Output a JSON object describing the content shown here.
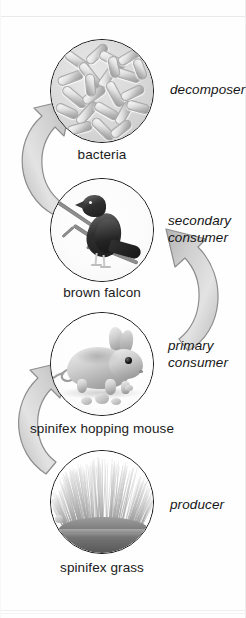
{
  "diagram": {
    "orientation": "vertical-cycle",
    "palette": {
      "ink": "#1b1b1b",
      "outline": "#15161a",
      "arrow_fill": "#d3d3d3",
      "arrow_edge": "#8f8f8f",
      "background": "#ffffff"
    }
  },
  "nodes": [
    {
      "id": "bacteria",
      "name": "bacteria",
      "role": "decomposer",
      "icon": "bacteria-icon",
      "role_lines": [
        "decomposer"
      ]
    },
    {
      "id": "falcon",
      "name": "brown falcon",
      "role": "secondary consumer",
      "icon": "falcon-icon",
      "role_lines": [
        "secondary",
        "consumer"
      ]
    },
    {
      "id": "mouse",
      "name": "spinifex hopping mouse",
      "role": "primary consumer",
      "icon": "hopping-mouse-icon",
      "role_lines": [
        "primary",
        "consumer"
      ]
    },
    {
      "id": "grass",
      "name": "spinifex grass",
      "role": "producer",
      "icon": "spinifex-grass-icon",
      "role_lines": [
        "producer"
      ]
    }
  ],
  "arrows": [
    {
      "id": "grass-to-mouse",
      "from": "spinifex grass",
      "to": "spinifex hopping mouse",
      "side": "left",
      "direction": "up"
    },
    {
      "id": "mouse-to-falcon",
      "from": "spinifex hopping mouse",
      "to": "brown falcon",
      "side": "right",
      "direction": "up"
    },
    {
      "id": "falcon-to-bacteria",
      "from": "brown falcon",
      "to": "bacteria",
      "side": "left",
      "direction": "up"
    }
  ]
}
